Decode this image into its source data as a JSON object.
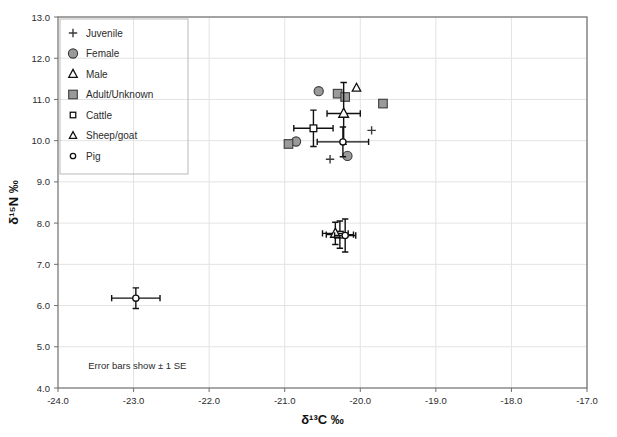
{
  "figure": {
    "note": "Error bars show ± 1 SE",
    "background": "#ffffff",
    "frame_color": "#6f6f6f",
    "grid_color": "#e3e3e3",
    "marker_fill": "#9a9a9a",
    "marker_stroke": "#3b3b3b"
  },
  "chart_data": {
    "type": "scatter",
    "title": "",
    "xlabel": "δ¹³C ‰",
    "ylabel": "δ¹⁵N ‰",
    "xlim": [
      -24.0,
      -17.0
    ],
    "ylim": [
      4.0,
      13.0
    ],
    "xticks": [
      -24.0,
      -23.0,
      -22.0,
      -21.0,
      -20.0,
      -19.0,
      -18.0,
      -17.0
    ],
    "xtick_labels": [
      "-24.0",
      "-23.0",
      "-22.0",
      "-21.0",
      "-20.0",
      "-19.0",
      "-18.0",
      "-17.0"
    ],
    "yticks": [
      4.0,
      5.0,
      6.0,
      7.0,
      8.0,
      9.0,
      10.0,
      11.0,
      12.0,
      13.0
    ],
    "ytick_labels": [
      "4.0",
      "5.0",
      "6.0",
      "7.0",
      "8.0",
      "9.0",
      "10.0",
      "11.0",
      "12.0",
      "13.0"
    ],
    "grid": true,
    "legend_position": "top-left",
    "annotations": [
      {
        "text": "Error bars show ± 1 SE",
        "x": -23.6,
        "y": 4.45
      }
    ],
    "series": [
      {
        "name": "Juvenile",
        "marker": "plus",
        "style": "line",
        "points": [
          {
            "x": -19.85,
            "y": 10.25
          },
          {
            "x": -20.4,
            "y": 9.55
          }
        ]
      },
      {
        "name": "Female",
        "marker": "circle",
        "style": "filled",
        "points": [
          {
            "x": -20.55,
            "y": 11.2
          },
          {
            "x": -20.85,
            "y": 9.98
          },
          {
            "x": -20.17,
            "y": 9.63
          }
        ]
      },
      {
        "name": "Male",
        "marker": "triangle",
        "style": "open",
        "points": [
          {
            "x": -20.05,
            "y": 11.28
          }
        ]
      },
      {
        "name": "Adult/Unknown",
        "marker": "square",
        "style": "filled",
        "points": [
          {
            "x": -20.3,
            "y": 11.14
          },
          {
            "x": -20.2,
            "y": 11.06
          },
          {
            "x": -19.7,
            "y": 10.9
          },
          {
            "x": -20.95,
            "y": 9.92
          }
        ]
      },
      {
        "name": "Cattle",
        "marker": "square",
        "style": "open-small",
        "errorbars": true,
        "points": [
          {
            "x": -20.62,
            "y": 10.3,
            "xerr": 0.26,
            "yerr": 0.44
          },
          {
            "x": -20.27,
            "y": 7.72,
            "xerr": 0.18,
            "yerr": 0.33
          }
        ]
      },
      {
        "name": "Sheep/goat",
        "marker": "triangle",
        "style": "open-small",
        "errorbars": true,
        "points": [
          {
            "x": -20.22,
            "y": 10.66,
            "xerr": 0.22,
            "yerr": 0.75
          },
          {
            "x": -20.33,
            "y": 7.75,
            "xerr": 0.17,
            "yerr": 0.27
          }
        ]
      },
      {
        "name": "Pig",
        "marker": "circle",
        "style": "open-small",
        "errorbars": true,
        "points": [
          {
            "x": -20.23,
            "y": 9.97,
            "xerr": 0.34,
            "yerr": 0.36
          },
          {
            "x": -20.2,
            "y": 7.7,
            "xerr": 0.14,
            "yerr": 0.4
          },
          {
            "x": -22.97,
            "y": 6.18,
            "xerr": 0.32,
            "yerr": 0.25
          }
        ]
      }
    ]
  },
  "legend": {
    "items": [
      {
        "label": "Juvenile",
        "marker": "plus"
      },
      {
        "label": "Female",
        "marker": "circle-filled"
      },
      {
        "label": "Male",
        "marker": "triangle-open"
      },
      {
        "label": "Adult/Unknown",
        "marker": "square-filled"
      },
      {
        "label": "Cattle",
        "marker": "square-open-small"
      },
      {
        "label": "Sheep/goat",
        "marker": "triangle-open-small"
      },
      {
        "label": "Pig",
        "marker": "circle-open-small"
      }
    ]
  }
}
